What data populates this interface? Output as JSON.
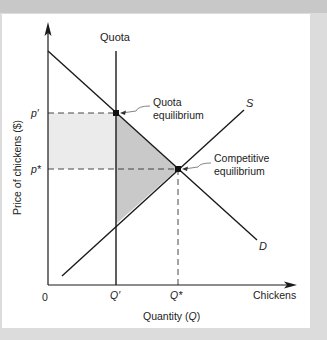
{
  "diagram": {
    "axes": {
      "y_label": "Price of chickens ($)",
      "x_label": "Quantity (Q)",
      "x_label_main": "Quantity (",
      "x_label_var": "Q",
      "x_label_close": ")",
      "x_end_label": "Chickens",
      "origin": "0"
    },
    "ticks": {
      "p_prime": "p′",
      "p_star": "p*",
      "q_prime": "Q′",
      "q_star": "Q*"
    },
    "curves": {
      "quota_label": "Quota",
      "supply_label": "S",
      "demand_label": "D"
    },
    "annotations": {
      "quota_eq_line1": "Quota",
      "quota_eq_line2": "equilibrium",
      "comp_eq_line1": "Competitive",
      "comp_eq_line2": "equilibrium"
    },
    "colors": {
      "background_border": "#dcdcdc",
      "panel": "#ffffff",
      "light_shade": "#ebebeb",
      "dark_shade": "#c9c9c9",
      "line": "#1a1a1a"
    }
  }
}
